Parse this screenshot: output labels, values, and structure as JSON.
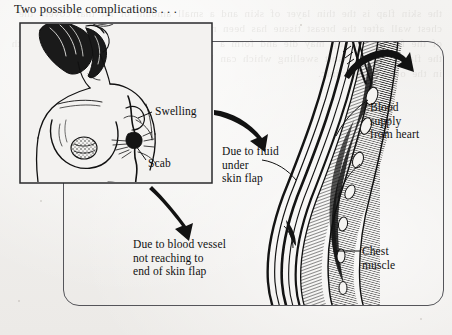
{
  "page": {
    "title": "Two possible complications . . .",
    "background_color": "#f2f1ef",
    "ink_color": "#1a1a1a",
    "bleed_through_text": "the skin flap is the thin layer of skin and a small amount of fat that covers the chest wall after the breast tissue has been removed. blood must reach the whole of the flap or the tip may die and form a scab. fluid may also collect underneath the flap causing a soft swelling which can be drained with a needle and syringe in the out-patient clinic."
  },
  "figure": {
    "inset_panel": {
      "name": "torso-inset",
      "description": "line drawing of a woman's chest after mastectomy showing scar line",
      "labels": [
        {
          "id": "swelling",
          "text": "Swelling"
        },
        {
          "id": "scab",
          "text": "Scab"
        }
      ]
    },
    "cross_section": {
      "name": "chest-wall-cross-section",
      "description": "side cross-section of chest wall showing skin flap, blood vessels and chest muscle",
      "labels": [
        {
          "id": "blood-supply",
          "text": "Blood\nsupply\nfrom heart",
          "lines": [
            "Blood",
            "supply",
            "from heart"
          ]
        },
        {
          "id": "chest-muscle",
          "text": "Chest\nmuscle",
          "lines": [
            "Chest",
            "muscle"
          ]
        }
      ]
    },
    "callouts": [
      {
        "id": "fluid-callout",
        "lines": [
          "Due to fluid",
          "under",
          "skin flap"
        ],
        "text": "Due to fluid under skin flap",
        "source": "swelling",
        "arrow": "curved-arrow-down-right"
      },
      {
        "id": "vessel-callout",
        "lines": [
          "Due to blood vessel",
          "not reaching to",
          "end of skin flap"
        ],
        "text": "Due to blood vessel not reaching to end of skin flap",
        "source": "scab",
        "arrow": "straight-arrow-down-right"
      }
    ],
    "arrows": [
      {
        "id": "arrow-to-fluid",
        "name": "curved-arrow-icon",
        "direction": "down-right"
      },
      {
        "id": "arrow-to-vessel",
        "name": "curved-arrow-icon",
        "direction": "down-right"
      },
      {
        "id": "arrow-blood-flow",
        "name": "curved-arrow-icon",
        "direction": "up-right"
      }
    ]
  }
}
